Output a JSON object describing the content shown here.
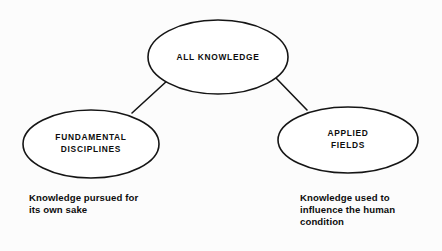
{
  "diagram": {
    "background_color": "#fcfcfc",
    "stroke_color": "#151515",
    "text_color": "#0d0d0d",
    "nodes": [
      {
        "id": "all-knowledge",
        "label_lines": [
          "ALL KNOWLEDGE"
        ],
        "line1": "ALL KNOWLEDGE",
        "cx": 218,
        "cy": 57,
        "rx": 70,
        "ry": 37
      },
      {
        "id": "fundamental-disciplines",
        "label_lines": [
          "FUNDAMENTAL",
          "DISCIPLINES"
        ],
        "line1": "FUNDAMENTAL",
        "line2": "DISCIPLINES",
        "cx": 91,
        "cy": 144,
        "rx": 68,
        "ry": 34
      },
      {
        "id": "applied-fields",
        "label_lines": [
          "APPLIED",
          "FIELDS"
        ],
        "line1": "APPLIED",
        "line2": "FIELDS",
        "cx": 348,
        "cy": 140,
        "rx": 70,
        "ry": 33
      }
    ],
    "connectors": [
      {
        "id": "connector-left",
        "from": "all-knowledge",
        "to": "fundamental-disciplines",
        "x1": 168,
        "y1": 80,
        "x2": 132,
        "y2": 113
      },
      {
        "id": "connector-right",
        "from": "all-knowledge",
        "to": "applied-fields",
        "x1": 275,
        "y1": 77,
        "x2": 307,
        "y2": 110
      }
    ],
    "captions": [
      {
        "id": "caption-fundamental",
        "for_node": "fundamental-disciplines",
        "lines": [
          "Knowledge pursued for",
          "its own sake"
        ],
        "line1": "Knowledge pursued for",
        "line2": "its own sake",
        "x": 29,
        "y": 201
      },
      {
        "id": "caption-applied",
        "for_node": "applied-fields",
        "lines": [
          "Knowledge used to",
          "influence the human",
          "condition"
        ],
        "line1": "Knowledge used to",
        "line2": "influence the human",
        "line3": "condition",
        "x": 300,
        "y": 201
      }
    ]
  }
}
